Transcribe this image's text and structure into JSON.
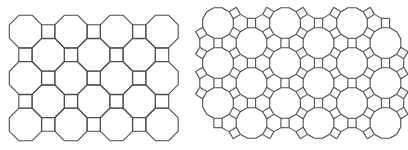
{
  "figure": {
    "width": 408,
    "height": 150,
    "background": "#ffffff",
    "stroke_color": "#4d4d4d",
    "panels": [
      {
        "id": "left",
        "name": "truncated-square-tiling",
        "vertex_configuration": "4.8.8",
        "shapes": [
          "octagon",
          "square"
        ],
        "octagon": {
          "grid_x": [
            25.5,
            71,
            116.5,
            162
          ],
          "grid_y": [
            31.5,
            78,
            124.5
          ],
          "offset_grid_x": [
            48.2,
            93.7,
            139.2
          ],
          "offset_grid_y": [
            54.8,
            101.3
          ],
          "flat_diameter": 32.4
        },
        "square": {
          "side": 13.4,
          "rows_between_octagons_x": [
            48.2,
            93.7,
            139.2
          ],
          "rows_between_octagons_y": [
            31.5,
            78,
            124.5
          ],
          "offset_rows_x": [
            25.5,
            71,
            116.5,
            162
          ],
          "offset_rows_y": [
            54.8,
            101.3
          ]
        }
      },
      {
        "id": "right",
        "name": "truncated-trihexagonal-tiling",
        "vertex_configuration": "4.6.12",
        "shapes": [
          "dodecagon",
          "hexagon",
          "square"
        ],
        "dodecagon": {
          "columns_x": [
            218,
            251.5,
            285,
            318.5,
            352,
            385.5
          ],
          "even_column_y": [
            23,
            63,
            103
          ],
          "odd_column_y": [
            43,
            83,
            123
          ],
          "edge": 8.2
        }
      }
    ]
  }
}
